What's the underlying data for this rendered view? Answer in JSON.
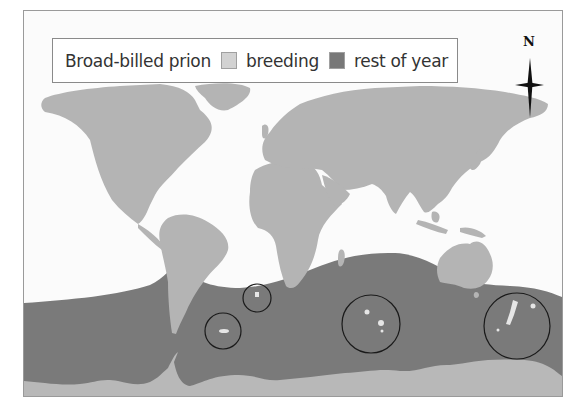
{
  "legend": {
    "species": "Broad-billed prion",
    "items": [
      {
        "label": "breeding",
        "color": "#d2d2d2"
      },
      {
        "label": "rest of year",
        "color": "#787878"
      }
    ]
  },
  "compass": {
    "north_label": "N"
  },
  "colors": {
    "ocean": "#fbfbfb",
    "land": "#b4b4b4",
    "range_rest_of_year": "#7a7a7a",
    "antarctica": "#b8b8b8",
    "circle_stroke": "#1a1a1a"
  },
  "breeding_site_circles": [
    {
      "name": "tristan-da-cunha-gough",
      "cx": 257,
      "cy": 298,
      "r": 14
    },
    {
      "name": "falklands-region",
      "cx": 223,
      "cy": 331,
      "r": 18
    },
    {
      "name": "southern-indian-ocean-islands",
      "cx": 371,
      "cy": 324,
      "r": 29
    },
    {
      "name": "new-zealand-subantarctic",
      "cx": 517,
      "cy": 326,
      "r": 33
    }
  ]
}
